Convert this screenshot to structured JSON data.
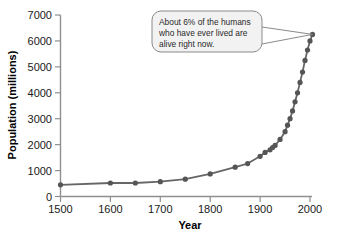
{
  "chart_data": {
    "type": "line",
    "title": "",
    "xlabel": "Year",
    "ylabel": "Population (millions)",
    "xlim": [
      1500,
      2010
    ],
    "ylim": [
      0,
      7000
    ],
    "xticks": [
      1500,
      1600,
      1700,
      1800,
      1900,
      2000
    ],
    "yticks": [
      0,
      1000,
      2000,
      3000,
      4000,
      5000,
      6000,
      7000
    ],
    "grid": false,
    "legend": null,
    "series_color": "#666666",
    "marker_color": "#555555",
    "x": [
      1500,
      1600,
      1650,
      1700,
      1750,
      1800,
      1850,
      1875,
      1900,
      1910,
      1920,
      1925,
      1930,
      1940,
      1950,
      1955,
      1960,
      1965,
      1970,
      1975,
      1980,
      1985,
      1990,
      1995,
      2000,
      2005
    ],
    "y": [
      450,
      520,
      520,
      570,
      670,
      870,
      1130,
      1270,
      1550,
      1700,
      1800,
      1890,
      1970,
      2200,
      2500,
      2750,
      3000,
      3300,
      3650,
      4000,
      4400,
      4800,
      5250,
      5650,
      6000,
      6250
    ],
    "annotations": [
      {
        "text_lines": [
          "About 6% of the humans",
          "who have ever lived are",
          "alive right now."
        ],
        "points_to_x": 2005,
        "points_to_y": 6250
      }
    ]
  },
  "axis": {
    "y_title": "Population (millions)",
    "x_title": "Year",
    "y_tick_labels": [
      "7000",
      "6000",
      "5000",
      "4000",
      "3000",
      "2000",
      "1000",
      "0"
    ],
    "x_tick_labels": [
      "1500",
      "1600",
      "1700",
      "1800",
      "1900",
      "2000"
    ]
  },
  "callout": {
    "line1": "About 6% of the humans",
    "line2": "who have ever lived are",
    "line3": "alive right now.",
    "fill_color": "#f2f2f2",
    "border_color": "#8a8a8a"
  },
  "colors": {
    "line": "#6b6b6b",
    "marker": "#565656",
    "axis": "#909090",
    "text": "#111111"
  }
}
